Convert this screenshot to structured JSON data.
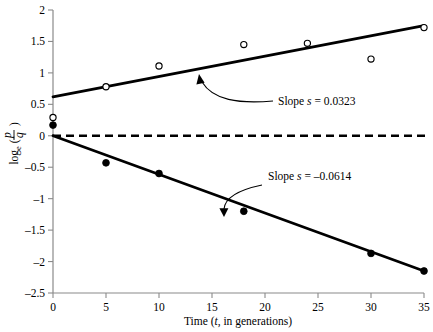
{
  "chart_data": {
    "type": "scatter",
    "title": "",
    "xlabel": "Time (t, in generations)",
    "ylabel": "loge (p/q)",
    "ylabel_parts": {
      "base": "log",
      "subscript": "e",
      "numerator": "p",
      "denominator": "q"
    },
    "xlim": [
      0,
      35
    ],
    "ylim": [
      -2.5,
      2
    ],
    "xticks": [
      0,
      5,
      10,
      15,
      20,
      25,
      30,
      35
    ],
    "xtick_labels": [
      "0",
      "5",
      "10",
      "15",
      "20",
      "25",
      "30",
      "35"
    ],
    "yticks": [
      -2.5,
      -2,
      -1.5,
      -1,
      -0.5,
      0,
      0.5,
      1,
      1.5,
      2
    ],
    "ytick_labels": [
      "–2.5",
      "–2",
      "–1.5",
      "–1",
      "–0.5",
      "0",
      "0.5",
      "1",
      "1.5",
      "2"
    ],
    "grid": false,
    "legend": "none",
    "reference_line": {
      "y": 0,
      "style": "dashed",
      "color": "#000000"
    },
    "series": [
      {
        "name": "upper-series",
        "marker": "open-circle",
        "slope": 0.0323,
        "intercept": 0.62,
        "fit_line": {
          "x": [
            0,
            35
          ],
          "y": [
            0.62,
            1.75
          ]
        },
        "points": [
          {
            "x": 0,
            "y": 0.29
          },
          {
            "x": 5,
            "y": 0.78
          },
          {
            "x": 10,
            "y": 1.11
          },
          {
            "x": 18,
            "y": 1.45
          },
          {
            "x": 24,
            "y": 1.47
          },
          {
            "x": 30,
            "y": 1.22
          },
          {
            "x": 35,
            "y": 1.72
          }
        ]
      },
      {
        "name": "lower-series",
        "marker": "filled-circle",
        "slope": -0.0614,
        "intercept": 0.0,
        "fit_line": {
          "x": [
            0,
            35
          ],
          "y": [
            0.0,
            -2.15
          ]
        },
        "points": [
          {
            "x": 0,
            "y": 0.17
          },
          {
            "x": 5,
            "y": -0.43
          },
          {
            "x": 10,
            "y": -0.6
          },
          {
            "x": 18,
            "y": -1.2
          },
          {
            "x": 30,
            "y": -1.87
          },
          {
            "x": 35,
            "y": -2.15
          }
        ]
      }
    ],
    "annotations": [
      {
        "name": "upper-slope-annotation",
        "text": "Slope s = 0.0323",
        "prefix": "Slope ",
        "symbol": "s",
        "value": " = 0.0323",
        "target": {
          "x": 14.0,
          "y": 1.08
        }
      },
      {
        "name": "lower-slope-annotation",
        "text": "Slope s = –0.0614",
        "prefix": "Slope ",
        "symbol": "s",
        "value": " = –0.0614",
        "target": {
          "x": 18.6,
          "y": -1.12
        }
      }
    ],
    "colors": {
      "line": "#000000",
      "marker_fill": "#000000",
      "marker_open": "#ffffff",
      "axis": "#808080",
      "annotation": "#000000"
    }
  }
}
